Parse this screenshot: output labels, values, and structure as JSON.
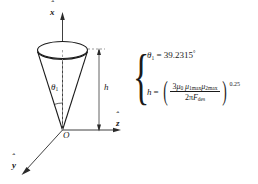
{
  "figure": {
    "type": "3d-cone-diagram",
    "origin_label": "O",
    "axes": [
      {
        "name": "x-axis",
        "label": "x",
        "hat": "ˆ",
        "direction": "up"
      },
      {
        "name": "z-axis",
        "label": "z",
        "hat": "ˆ",
        "direction": "right"
      },
      {
        "name": "y-axis",
        "label": "y",
        "hat": "ˆ",
        "direction": "lower-left"
      }
    ],
    "cone": {
      "apex_at": "O",
      "angle_label": "θ",
      "angle_subscript": "1",
      "height_label": "h"
    }
  },
  "equations": {
    "brace": "{",
    "theta": {
      "symbol": "θ",
      "subscript": "1",
      "relation": "=",
      "value": "39.2315",
      "unit": "°",
      "full": "θ₁ = 39.2315°"
    },
    "height": {
      "symbol": "h",
      "relation": "=",
      "numerator_lead": "3",
      "numerator": "μ₀ μ₁max μ₂max",
      "num_mu0": "μ",
      "num_mu0_sub": "0",
      "num_mu1": "μ",
      "num_mu1_sub": "1max",
      "num_mu2": "μ",
      "num_mu2_sub": "2max",
      "den_lead": "2π",
      "den_F": "F",
      "den_F_sub": "des",
      "denominator": "2πF_des",
      "exponent": "0.25",
      "full": "h = (3μ₀μ₁maxμ₂max / 2πF_des)^0.25"
    }
  },
  "colors": {
    "ink": "#1a1a1a",
    "background": "#ffffff",
    "dashed": "#9a9a9a"
  }
}
